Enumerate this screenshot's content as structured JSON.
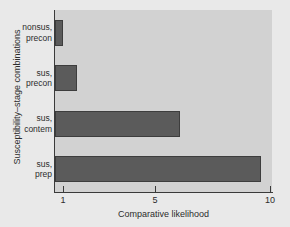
{
  "chart_data": {
    "type": "bar",
    "orientation": "horizontal",
    "title": "",
    "xlabel": "Comparative likelihood",
    "ylabel": "Susceptibility–stage combinations",
    "categories": [
      "nonsus,\nprecon",
      "sus,\nprecon",
      "sus,\ncontem",
      "sus,\nprep"
    ],
    "category_lines": [
      [
        "nonsus,",
        "precon"
      ],
      [
        "sus,",
        "precon"
      ],
      [
        "sus,",
        "contem"
      ],
      [
        "sus,",
        "prep"
      ]
    ],
    "values": [
      1.0,
      1.6,
      6.1,
      9.6
    ],
    "xticks": [
      1,
      5,
      10
    ],
    "xticklabels": [
      "1",
      "5",
      "10"
    ],
    "xlim": [
      0.6,
      10.1
    ],
    "grid": false,
    "legend": false,
    "colors": {
      "bar_fill": "#5b5b5b",
      "bar_edge": "#3d3d3d",
      "panel_background": "#d2d2d2",
      "figure_background": "#e9e9e9",
      "axis": "#3a3a3a",
      "text": "#2c2c2c"
    }
  }
}
